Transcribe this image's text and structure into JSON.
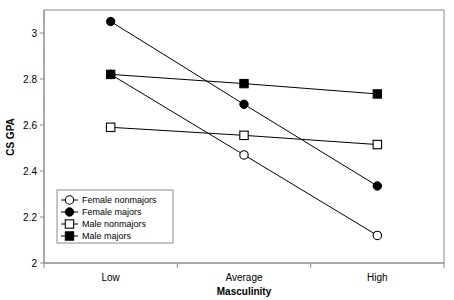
{
  "chart_data": {
    "type": "line",
    "title": "",
    "subtitle": "",
    "xlabel": "Masculinity",
    "ylabel": "CS GPA",
    "categories": [
      "Low",
      "Average",
      "High"
    ],
    "ylim": [
      2,
      3.05
    ],
    "yticks": [
      "2",
      "2.2",
      "2.4",
      "2.6",
      "2.8",
      "3"
    ],
    "ytick_values": [
      2,
      2.2,
      2.4,
      2.6,
      2.8,
      3
    ],
    "grid": false,
    "legend_position": "bottom-left",
    "series": [
      {
        "name": "Female nonmajors",
        "marker": "open-circle",
        "values": [
          2.82,
          2.47,
          2.12
        ]
      },
      {
        "name": "Female majors",
        "marker": "filled-circle",
        "values": [
          3.05,
          2.69,
          2.335
        ]
      },
      {
        "name": "Male nonmajors",
        "marker": "open-square",
        "values": [
          2.59,
          2.555,
          2.515
        ]
      },
      {
        "name": "Male majors",
        "marker": "filled-square",
        "values": [
          2.82,
          2.78,
          2.735
        ]
      }
    ],
    "colors": {
      "line": "#000000",
      "marker_fill": "#000000",
      "marker_open_fill": "#ffffff",
      "axis": "#808080",
      "plot_border": "#808080",
      "background": "#ffffff"
    }
  }
}
